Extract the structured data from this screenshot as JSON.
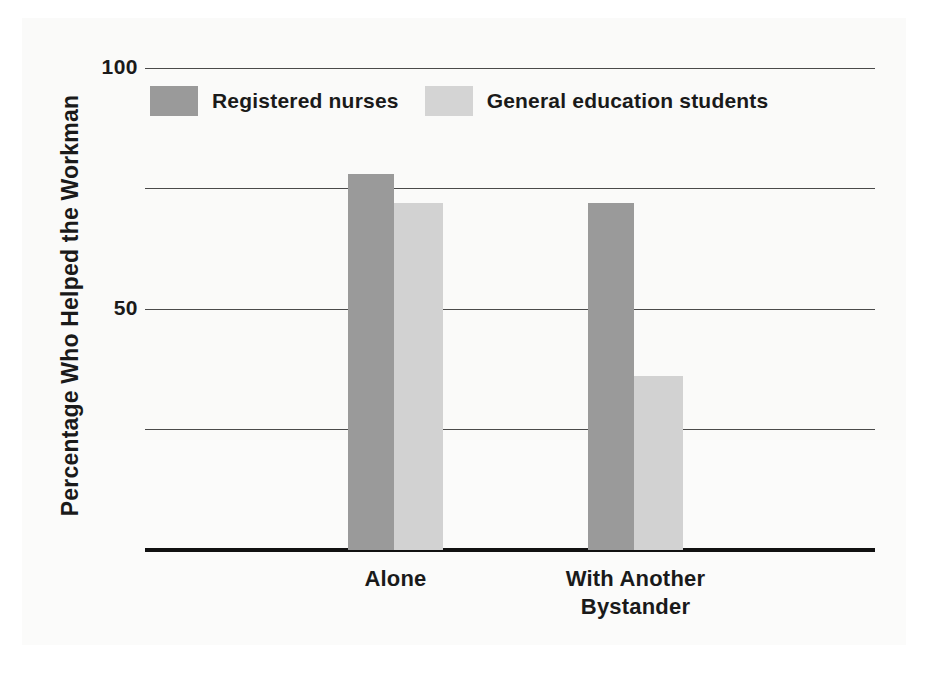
{
  "chart_data": {
    "type": "bar",
    "title": "",
    "xlabel": "",
    "ylabel": "Percentage Who Helped the Workman",
    "ylim": [
      0,
      100
    ],
    "ytick_values": [
      100,
      75,
      50,
      25
    ],
    "ytick_labels": [
      "100",
      "",
      "50",
      ""
    ],
    "ytick_labels_visible": [
      "100",
      "50"
    ],
    "grid": true,
    "legend_position": "top-left inside axes",
    "categories": [
      "Alone",
      "With Another Bystander"
    ],
    "category_lines": [
      [
        "Alone"
      ],
      [
        "With Another",
        "Bystander"
      ]
    ],
    "series": [
      {
        "name": "Registered nurses",
        "color": "#9a9a9a",
        "values": [
          78,
          72
        ]
      },
      {
        "name": "General education students",
        "color": "#d2d2d2",
        "values": [
          72,
          36
        ]
      }
    ]
  },
  "legend": {
    "items": [
      {
        "label": "Registered nurses",
        "swatch": "dark"
      },
      {
        "label": "General education students",
        "swatch": "light"
      }
    ]
  },
  "axes": {
    "y_title": "Percentage Who Helped the Workman",
    "y_ticks": [
      {
        "value": 100,
        "label": "100"
      },
      {
        "value": 75,
        "label": ""
      },
      {
        "value": 50,
        "label": "50"
      },
      {
        "value": 25,
        "label": ""
      }
    ]
  },
  "colors": {
    "series_dark": "#9a9a9a",
    "series_light": "#d2d2d2",
    "gridline": "#4a4a4a",
    "axis": "#111111",
    "text": "#1a1a1a",
    "page_background": "#ffffff",
    "scan_panel": "#fafaf9"
  }
}
